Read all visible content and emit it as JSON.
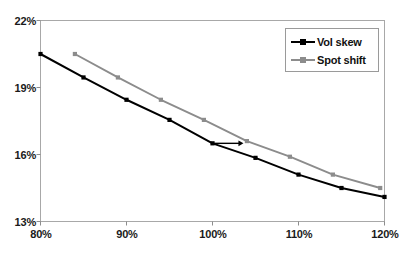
{
  "chart_data": {
    "type": "line",
    "title": "",
    "subtitle": "",
    "xlabel": "",
    "ylabel": "",
    "xlim": [
      80,
      120
    ],
    "ylim": [
      13,
      22
    ],
    "x_tick_labels": [
      "80%",
      "90%",
      "100%",
      "110%",
      "120%"
    ],
    "x_ticks": [
      80,
      90,
      100,
      110,
      120
    ],
    "y_tick_labels": [
      "13%",
      "16%",
      "19%",
      "22%"
    ],
    "y_ticks": [
      13,
      16,
      19,
      22
    ],
    "grid": false,
    "legend_position": "top-right",
    "series": [
      {
        "name": "Vol skew",
        "color": "#000000",
        "marker": "square",
        "x": [
          80,
          85,
          90,
          95,
          100,
          105,
          110,
          115,
          120
        ],
        "values": [
          20.5,
          19.45,
          18.45,
          17.55,
          16.5,
          15.85,
          15.1,
          14.5,
          14.1
        ]
      },
      {
        "name": "Spot shift",
        "color": "#8c8c8c",
        "marker": "square",
        "x": [
          84,
          89,
          94,
          99,
          104,
          109,
          114,
          119.5
        ],
        "values": [
          20.5,
          19.45,
          18.45,
          17.55,
          16.6,
          15.9,
          15.1,
          14.5
        ]
      }
    ],
    "annotations": [
      {
        "type": "arrow",
        "label": "",
        "color": "#000000",
        "from": {
          "x": 100,
          "y": 16.5
        },
        "to": {
          "x": 103.6,
          "y": 16.5
        }
      }
    ]
  },
  "legend": {
    "items": [
      {
        "label": "Vol skew",
        "color": "#000000"
      },
      {
        "label": "Spot shift",
        "color": "#8c8c8c"
      }
    ]
  },
  "axes": {
    "y_labels": [
      "22%",
      "19%",
      "16%",
      "13%"
    ],
    "x_labels": [
      "80%",
      "90%",
      "100%",
      "110%",
      "120%"
    ]
  },
  "colors": {
    "series_1": "#000000",
    "series_2": "#8c8c8c",
    "frame": "#a8a8a8",
    "background": "#ffffff",
    "text": "#111111"
  }
}
